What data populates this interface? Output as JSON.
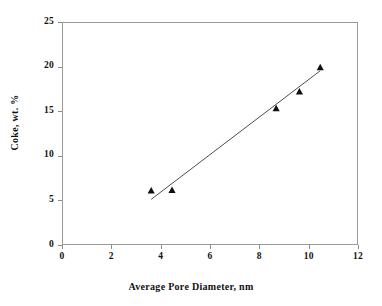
{
  "chart_data": {
    "type": "scatter",
    "title": "",
    "xlabel": "Average Pore Diameter, nm",
    "ylabel": "Coke, wt. %",
    "xlim": [
      0,
      12
    ],
    "ylim": [
      0,
      25
    ],
    "xticks": [
      0,
      2,
      4,
      6,
      8,
      10,
      12
    ],
    "yticks": [
      0,
      5,
      10,
      15,
      20,
      25
    ],
    "xtick_labels": [
      "0",
      "2",
      "4",
      "6",
      "8",
      "10",
      "12"
    ],
    "ytick_labels": [
      "0",
      "5",
      "10",
      "15",
      "20",
      "25"
    ],
    "grid": false,
    "legend": false,
    "marker_style": "triangle-up",
    "marker_color": "#101010",
    "series": [
      {
        "name": "Coke vs Average Pore Diameter",
        "x": [
          3.6,
          4.45,
          8.7,
          9.65,
          10.5
        ],
        "y": [
          6.05,
          6.1,
          15.35,
          17.25,
          20.0
        ]
      }
    ],
    "trendline": {
      "type": "linear",
      "x": [
        3.6,
        10.5
      ],
      "y": [
        5.05,
        19.6
      ],
      "color": "#4a4a4a"
    },
    "axis_color": "#9a9a9a",
    "background": "#ffffff"
  }
}
